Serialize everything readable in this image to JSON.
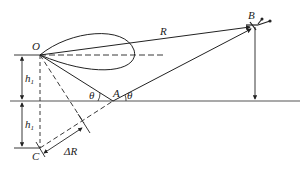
{
  "diagram": {
    "type": "multipath geometry (antenna height / reflected ray)",
    "points": {
      "O": {
        "label": "O",
        "x": 40,
        "y": 55
      },
      "A": {
        "label": "A",
        "x": 113,
        "y": 101
      },
      "B": {
        "label": "B",
        "x": 253,
        "y": 27
      },
      "C": {
        "label": "C",
        "x": 40,
        "y": 148
      }
    },
    "labels": {
      "R": "R",
      "theta_left": "θ",
      "theta_right": "θ",
      "h1_upper": "h",
      "h1_upper_sub": "1",
      "h1_lower": "h",
      "h1_lower_sub": "1",
      "delta_R": "ΔR"
    },
    "colors": {
      "line": "#222222",
      "ground": "#555555",
      "background": "#ffffff"
    }
  }
}
